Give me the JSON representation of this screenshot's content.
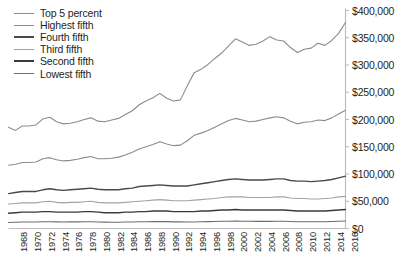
{
  "chart_data": {
    "type": "line",
    "title": "",
    "subtitle": "",
    "xlabel": "",
    "ylabel": "",
    "grid": false,
    "legend_position": "top-left",
    "y_axis_position": "right",
    "xlim": [
      1967,
      2016
    ],
    "ylim": [
      0,
      400000
    ],
    "y_ticks": [
      0,
      50000,
      100000,
      150000,
      200000,
      250000,
      300000,
      350000,
      400000
    ],
    "y_tick_labels": [
      "$0",
      "$50,000",
      "$100,000",
      "$150,000",
      "$200,000",
      "$250,000",
      "$300,000",
      "$350,000",
      "$400,000"
    ],
    "x_tick_labels": [
      "1968",
      "1970",
      "1972",
      "1974",
      "1976",
      "1978",
      "1980",
      "1982",
      "1984",
      "1986",
      "1988",
      "1990",
      "1992",
      "1994",
      "1996",
      "1998",
      "2000",
      "2002",
      "2004",
      "2006",
      "2008",
      "2010",
      "2012",
      "2014",
      "2016"
    ],
    "x": [
      1967,
      1968,
      1969,
      1970,
      1971,
      1972,
      1973,
      1974,
      1975,
      1976,
      1977,
      1978,
      1979,
      1980,
      1981,
      1982,
      1983,
      1984,
      1985,
      1986,
      1987,
      1988,
      1989,
      1990,
      1991,
      1992,
      1993,
      1994,
      1995,
      1996,
      1997,
      1998,
      1999,
      2000,
      2001,
      2002,
      2003,
      2004,
      2005,
      2006,
      2007,
      2008,
      2009,
      2010,
      2011,
      2012,
      2013,
      2014,
      2015,
      2016
    ],
    "series": [
      {
        "name": "Top 5 percent",
        "color": "#8c8c8c",
        "width": 1.1,
        "values": [
          186000,
          180000,
          188000,
          188000,
          190000,
          201000,
          204000,
          196000,
          192000,
          193000,
          196000,
          200000,
          203000,
          197000,
          196000,
          199000,
          202000,
          209000,
          216000,
          227000,
          234000,
          240000,
          248000,
          239000,
          234000,
          236000,
          262000,
          286000,
          292000,
          301000,
          312000,
          322000,
          335000,
          348000,
          342000,
          336000,
          338000,
          344000,
          352000,
          346000,
          344000,
          332000,
          323000,
          329000,
          331000,
          340000,
          336000,
          345000,
          358000,
          378000
        ]
      },
      {
        "name": "Highest fifth",
        "color": "#8c8c8c",
        "width": 1.1,
        "values": [
          116000,
          118000,
          121000,
          121000,
          122000,
          128000,
          130000,
          126000,
          124000,
          125000,
          127000,
          130000,
          132000,
          128000,
          128000,
          129000,
          131000,
          135000,
          140000,
          146000,
          150000,
          154000,
          159000,
          155000,
          152000,
          153000,
          161000,
          171000,
          175000,
          180000,
          186000,
          192000,
          198000,
          202000,
          199000,
          196000,
          197000,
          200000,
          203000,
          205000,
          203000,
          197000,
          192000,
          195000,
          196000,
          199000,
          198000,
          203000,
          210000,
          217000
        ]
      },
      {
        "name": "Fourth fifth",
        "color": "#4a4a4a",
        "width": 1.4,
        "values": [
          64000,
          66000,
          68000,
          68000,
          68000,
          71000,
          73000,
          71000,
          70000,
          71000,
          72000,
          73000,
          74000,
          72000,
          71000,
          71000,
          71000,
          73000,
          74000,
          77000,
          78000,
          79000,
          80000,
          79000,
          78000,
          78000,
          78000,
          80000,
          82000,
          84000,
          86000,
          88000,
          90000,
          91000,
          90000,
          89000,
          89000,
          89000,
          90000,
          91000,
          91000,
          88000,
          87000,
          87000,
          86000,
          87000,
          88000,
          90000,
          93000,
          96000
        ]
      },
      {
        "name": "Third fifth",
        "color": "#a3a3a3",
        "width": 1.1,
        "values": [
          45000,
          46000,
          47000,
          47000,
          47000,
          49000,
          50000,
          48000,
          47000,
          48000,
          48000,
          49000,
          50000,
          48000,
          47000,
          47000,
          47000,
          48000,
          49000,
          50000,
          51000,
          52000,
          53000,
          52000,
          51000,
          51000,
          51000,
          52000,
          53000,
          54000,
          55000,
          57000,
          58000,
          58000,
          58000,
          57000,
          57000,
          57000,
          57000,
          58000,
          58000,
          56000,
          55000,
          55000,
          54000,
          54000,
          55000,
          56000,
          58000,
          59000
        ]
      },
      {
        "name": "Second fifth",
        "color": "#3a3a3a",
        "width": 1.4,
        "values": [
          28000,
          29000,
          30000,
          30000,
          30000,
          31000,
          31000,
          30000,
          30000,
          30000,
          30000,
          31000,
          31000,
          30000,
          29000,
          29000,
          29000,
          30000,
          30000,
          31000,
          31000,
          32000,
          32000,
          32000,
          31000,
          31000,
          31000,
          31000,
          32000,
          32000,
          33000,
          34000,
          34000,
          35000,
          34000,
          34000,
          34000,
          34000,
          34000,
          34000,
          34000,
          33000,
          32000,
          32000,
          32000,
          32000,
          32000,
          33000,
          34000,
          35000
        ]
      },
      {
        "name": "Lowest fifth",
        "color": "#6e6e6e",
        "width": 1.1,
        "values": [
          11000,
          11500,
          12000,
          12000,
          12000,
          12500,
          12500,
          12200,
          12000,
          12200,
          12200,
          12500,
          12500,
          12000,
          11700,
          11600,
          11600,
          11800,
          12000,
          12300,
          12500,
          12600,
          12800,
          12600,
          12200,
          12100,
          11900,
          12000,
          12400,
          12600,
          12900,
          13200,
          13400,
          13600,
          13400,
          13200,
          13100,
          13100,
          13100,
          13200,
          13200,
          12800,
          12500,
          12400,
          12300,
          12300,
          12500,
          12800,
          13300,
          13800
        ]
      }
    ]
  },
  "axes": {
    "spine_color": "#bfbfbf"
  },
  "legend": {
    "items": [
      {
        "label": "Top 5 percent"
      },
      {
        "label": "Highest fifth"
      },
      {
        "label": "Fourth fifth"
      },
      {
        "label": "Third fifth"
      },
      {
        "label": "Second fifth"
      },
      {
        "label": "Lowest fifth"
      }
    ]
  }
}
